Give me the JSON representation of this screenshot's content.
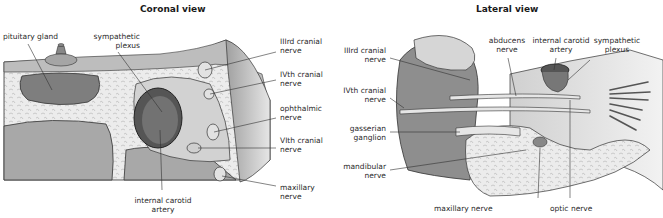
{
  "coronal": {
    "title": "Coronal view",
    "labels": {
      "pituitary_gland": "pituitary gland",
      "sympathetic_plexus_1": "sympathetic",
      "sympathetic_plexus_2": "plexus",
      "iii_cranial_1": "IIIrd cranial",
      "iii_cranial_2": "nerve",
      "iv_cranial_1": "IVth cranial",
      "iv_cranial_2": "nerve",
      "ophthalmic_1": "ophthalmic",
      "ophthalmic_2": "nerve",
      "vi_cranial_1": "VIth cranial",
      "vi_cranial_2": "nerve",
      "maxillary_1": "maxillary",
      "maxillary_2": "nerve",
      "ica_1": "internal carotid",
      "ica_2": "artery"
    }
  },
  "lateral": {
    "title": "Lateral view",
    "labels": {
      "iii_cranial_1": "IIIrd cranial",
      "iii_cranial_2": "nerve",
      "iv_cranial_1": "IVth cranial",
      "iv_cranial_2": "nerve",
      "gasserian_1": "gasserian",
      "gasserian_2": "ganglion",
      "mandibular_1": "mandibular",
      "mandibular_2": "nerve",
      "abducens_1": "abducens",
      "abducens_2": "nerve",
      "ica_1": "internal carotid",
      "ica_2": "artery",
      "sympathetic_1": "sympathetic",
      "sympathetic_2": "plexus",
      "maxillary": "maxillary nerve",
      "optic": "optic nerve"
    }
  },
  "colors": {
    "tissue_dark": "#8a8a8a",
    "tissue_mid": "#b4b4b4",
    "tissue_light": "#d9d9d9",
    "bone": "#ececec",
    "vessel": "#5e5e5e",
    "outline": "#333333"
  }
}
